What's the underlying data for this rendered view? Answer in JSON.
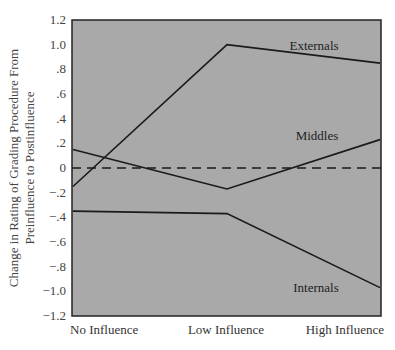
{
  "chart_data": {
    "type": "line",
    "title": "",
    "xlabel": "",
    "ylabel": "Change in Rating of Grading Procedure From Preinfluence to Postinfluence",
    "ylabel_lines": [
      "Change in Rating of Grading Procedure From",
      "Preinfluence to Postinfluence"
    ],
    "categories": [
      "No Influence",
      "Low Influence",
      "High Influence"
    ],
    "ylim": [
      -1.2,
      1.2
    ],
    "yticks": [
      1.2,
      1.0,
      0.8,
      0.6,
      0.4,
      0.2,
      0,
      -0.2,
      -0.4,
      -0.6,
      -0.8,
      -1.0,
      -1.2
    ],
    "ytick_labels": [
      "1.2",
      "1.0",
      ".8",
      ".6",
      ".4",
      ".2",
      "0",
      "−.2",
      "−.4",
      "−.6",
      "−.8",
      "−1.0",
      "−1.2"
    ],
    "grid": false,
    "legend": "inline labels",
    "reference_line": {
      "y": 0,
      "style": "dashed"
    },
    "series": [
      {
        "name": "Externals",
        "values": [
          -0.15,
          1.0,
          0.85
        ],
        "label_pos": {
          "x": 314,
          "y": 50
        }
      },
      {
        "name": "Middles",
        "values": [
          0.15,
          -0.17,
          0.23
        ],
        "label_pos": {
          "x": 317,
          "y": 140
        }
      },
      {
        "name": "Internals",
        "values": [
          -0.35,
          -0.37,
          -0.97
        ],
        "label_pos": {
          "x": 316,
          "y": 292
        }
      }
    ],
    "colors": {
      "plot_bg": "#a9a9a9",
      "line": "#1a1a1a",
      "frame": "#222222"
    }
  }
}
